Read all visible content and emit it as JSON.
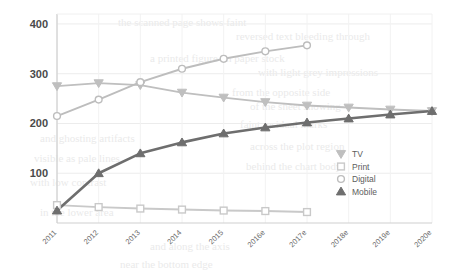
{
  "chart_data": {
    "type": "line",
    "title": "",
    "xlabel": "",
    "ylabel": "",
    "categories": [
      "2011",
      "2012",
      "2013",
      "2014",
      "2015",
      "2016e",
      "2017e",
      "2018e",
      "2019e",
      "2020e"
    ],
    "ylim": [
      0,
      420
    ],
    "yticks": [
      100,
      200,
      300,
      400
    ],
    "ytick_labels": [
      "100",
      "200",
      "300",
      "400"
    ],
    "grid": true,
    "legend_position": "inside-right",
    "series": [
      {
        "name": "TV",
        "marker": "triangle-down",
        "color": "#bfbfbf",
        "values": [
          275,
          281,
          277,
          262,
          252,
          243,
          236,
          232,
          228,
          225
        ]
      },
      {
        "name": "Print",
        "marker": "square",
        "color": "#c9c9c9",
        "values": [
          36,
          32,
          29,
          27,
          25,
          24,
          22,
          null,
          null,
          null
        ]
      },
      {
        "name": "Digital",
        "marker": "circle",
        "color": "#bdbdbd",
        "values": [
          215,
          248,
          283,
          310,
          330,
          345,
          357,
          null,
          null,
          null
        ]
      },
      {
        "name": "Mobile",
        "marker": "triangle-up",
        "color": "#6e6e6e",
        "values": [
          25,
          100,
          140,
          162,
          180,
          192,
          202,
          210,
          218,
          225
        ]
      }
    ]
  },
  "legend": {
    "items": [
      {
        "label": "TV"
      },
      {
        "label": "Print"
      },
      {
        "label": "Digital"
      },
      {
        "label": "Mobile"
      }
    ]
  },
  "ghost_text": [
    {
      "text": "the scanned page shows faint",
      "x": 118,
      "y": 16
    },
    {
      "text": "reversed text bleeding through",
      "x": 236,
      "y": 30
    },
    {
      "text": "a printed figure on paper stock",
      "x": 150,
      "y": 52
    },
    {
      "text": "with light grey impressions",
      "x": 258,
      "y": 66
    },
    {
      "text": "from the opposite side",
      "x": 232,
      "y": 86
    },
    {
      "text": "of the sheet showing",
      "x": 250,
      "y": 100
    },
    {
      "text": "faint residual marks",
      "x": 240,
      "y": 118
    },
    {
      "text": "and ghosting artifacts",
      "x": 40,
      "y": 132
    },
    {
      "text": "across the plot region",
      "x": 250,
      "y": 140
    },
    {
      "text": "visible as pale lines",
      "x": 34,
      "y": 152
    },
    {
      "text": "behind the chart body",
      "x": 246,
      "y": 160
    },
    {
      "text": "with low contrast",
      "x": 30,
      "y": 176
    },
    {
      "text": "in the lower area",
      "x": 40,
      "y": 206
    },
    {
      "text": "and along the axis",
      "x": 150,
      "y": 240
    },
    {
      "text": "near the bottom edge",
      "x": 120,
      "y": 258
    }
  ]
}
